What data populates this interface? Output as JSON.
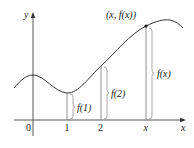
{
  "figure": {
    "axes": {
      "x_label": "x",
      "y_label": "y",
      "origin_label": "0",
      "x_ticks": [
        "1",
        "2",
        "x"
      ]
    },
    "point_label": "(x, f(x))",
    "heights": {
      "f1": "f(1)",
      "f2": "f(2)",
      "fx": "f(x)"
    },
    "colors": {
      "line": "#333333",
      "axis": "#444444",
      "segment": "#777777"
    }
  }
}
